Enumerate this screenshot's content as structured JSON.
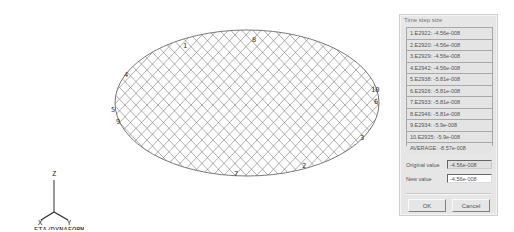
{
  "viewport": {
    "mesh_color": "#6a6a6a",
    "node_labels": [
      {
        "text": "1",
        "x": 183,
        "y": 48
      },
      {
        "text": "8",
        "x": 252,
        "y": 42
      },
      {
        "text": "4",
        "x": 124,
        "y": 77
      },
      {
        "text": "5",
        "x": 111,
        "y": 112
      },
      {
        "text": "9",
        "x": 116,
        "y": 124
      },
      {
        "text": "10",
        "x": 371,
        "y": 92
      },
      {
        "text": "6",
        "x": 374,
        "y": 104
      },
      {
        "text": "3",
        "x": 360,
        "y": 140
      },
      {
        "text": "7",
        "x": 234,
        "y": 176
      },
      {
        "text": "2",
        "x": 302,
        "y": 168
      }
    ],
    "triad": {
      "z_label": "Z",
      "x_label": "X",
      "y_label": "Y",
      "brand": "ETA/DYNAFORM"
    }
  },
  "dialog": {
    "title": "Time step size",
    "items": [
      "1.E2922: -4.56e-008",
      "2.E2920: -4.56e-008",
      "3.E2929: -4.56e-008",
      "4.E2942: -4.56e-008",
      "5.E2938: -5.81e-008",
      "6.E2926: -5.81e-008",
      "7.E2933: -5.81e-008",
      "8.E2946: -5.81e-008",
      "9.E2934: -5.9e-008",
      "10.E2925: -5.9e-008"
    ],
    "average": "AVERAGE: -8.57e-008",
    "original_value_label": "Original value",
    "original_value": "-4.56e-008",
    "new_value_label": "New value",
    "new_value": "-4.56e-008",
    "ok_label": "OK",
    "cancel_label": "Cancel"
  }
}
